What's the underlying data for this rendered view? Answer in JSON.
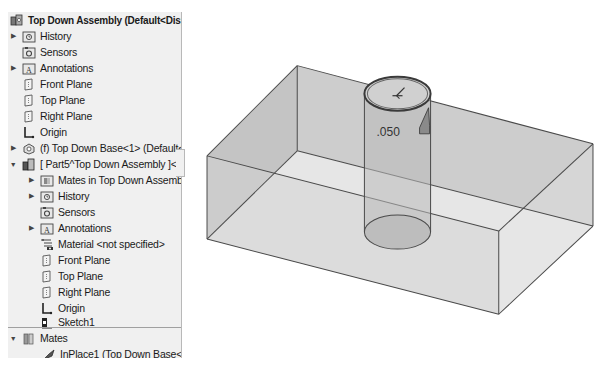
{
  "tree": {
    "root": {
      "label": "Top Down Assembly  (Default<Display St",
      "icon": "assembly-icon"
    },
    "items": [
      {
        "label": "History",
        "icon": "history-folder-icon",
        "expandable": true,
        "expanded": false,
        "level": 1
      },
      {
        "label": "Sensors",
        "icon": "sensors-folder-icon",
        "expandable": false,
        "level": 1
      },
      {
        "label": "Annotations",
        "icon": "annotations-folder-icon",
        "expandable": true,
        "expanded": false,
        "level": 1
      },
      {
        "label": "Front Plane",
        "icon": "plane-icon",
        "expandable": false,
        "level": 1
      },
      {
        "label": "Top Plane",
        "icon": "plane-icon",
        "expandable": false,
        "level": 1
      },
      {
        "label": "Right Plane",
        "icon": "plane-icon",
        "expandable": false,
        "level": 1
      },
      {
        "label": "Origin",
        "icon": "origin-icon",
        "expandable": false,
        "level": 1
      },
      {
        "label": "(f) Top Down Base<1> (Default<<De",
        "icon": "part-icon",
        "expandable": true,
        "expanded": false,
        "level": 1
      },
      {
        "label": "[ Part5^Top Down Assembly ]<1> (D",
        "icon": "virtual-part-icon",
        "expandable": true,
        "expanded": true,
        "level": 1
      },
      {
        "label": "Mates in Top Down Assembly",
        "icon": "mates-folder-icon",
        "expandable": true,
        "expanded": false,
        "level": 2
      },
      {
        "label": "History",
        "icon": "history-folder-icon",
        "expandable": true,
        "expanded": false,
        "level": 2
      },
      {
        "label": "Sensors",
        "icon": "sensors-folder-icon",
        "expandable": false,
        "level": 2
      },
      {
        "label": "Annotations",
        "icon": "annotations-folder-icon",
        "expandable": true,
        "expanded": false,
        "level": 2
      },
      {
        "label": "Material <not specified>",
        "icon": "material-icon",
        "expandable": false,
        "level": 2
      },
      {
        "label": "Front Plane",
        "icon": "plane-icon",
        "expandable": false,
        "level": 2
      },
      {
        "label": "Top Plane",
        "icon": "plane-icon",
        "expandable": false,
        "level": 2
      },
      {
        "label": "Right Plane",
        "icon": "plane-icon",
        "expandable": false,
        "level": 2
      },
      {
        "label": "Origin",
        "icon": "origin-icon",
        "expandable": false,
        "level": 2
      },
      {
        "label": "Sketch1",
        "icon": "sketch-icon",
        "expandable": false,
        "level": 2
      }
    ],
    "mates": {
      "label": "Mates",
      "icon": "mates-icon",
      "expanded": true,
      "children": [
        {
          "label": "InPlace1 (Top Down Base<1>,Pa",
          "icon": "inplace-mate-icon"
        }
      ]
    }
  },
  "viewport": {
    "dimension_label": ".050",
    "colors": {
      "edge": "#4a4a4a",
      "face_light": "#e4e4e4",
      "face_mid": "#cfcfcf",
      "face_dark": "#bdbdbd",
      "background": "#ffffff"
    }
  }
}
